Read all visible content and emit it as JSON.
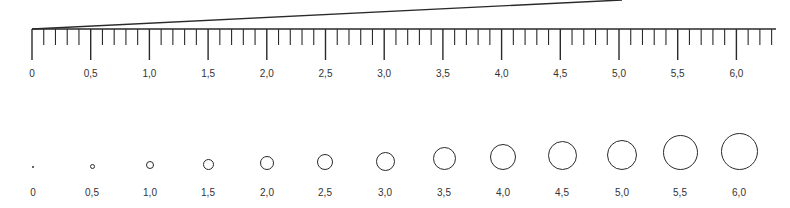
{
  "diagram": {
    "type": "scale-ruler-with-circle-sizes",
    "ruler": {
      "x0": 32,
      "unit_px_per_half": 58.7,
      "baseline_y": 29,
      "end_x": 776,
      "major_tick_bottom": 60,
      "minor_tick_bottom": 45,
      "minor_divisions_per_half": 5,
      "label_y": 69,
      "slant_line": {
        "x1": 32,
        "y1": 29,
        "x2": 622,
        "y2": 0
      },
      "labels": [
        "0",
        "0,5",
        "1,0",
        "1,5",
        "2,0",
        "2,5",
        "3,0",
        "3,5",
        "4,0",
        "4,5",
        "5,0",
        "5,5",
        "6,0"
      ]
    },
    "circles": {
      "label_y": 188,
      "items": [
        {
          "label": "0",
          "cx": 33,
          "cy": 167,
          "d": 2
        },
        {
          "label": "0,5",
          "cx": 92,
          "cy": 166,
          "d": 5
        },
        {
          "label": "1,0",
          "cx": 150,
          "cy": 165,
          "d": 8
        },
        {
          "label": "1,5",
          "cx": 208,
          "cy": 164,
          "d": 11
        },
        {
          "label": "2,0",
          "cx": 267,
          "cy": 163,
          "d": 14
        },
        {
          "label": "2,5",
          "cx": 325,
          "cy": 162,
          "d": 16
        },
        {
          "label": "3,0",
          "cx": 385,
          "cy": 161,
          "d": 19
        },
        {
          "label": "3,5",
          "cx": 444,
          "cy": 158,
          "d": 23
        },
        {
          "label": "4,0",
          "cx": 503,
          "cy": 157,
          "d": 26
        },
        {
          "label": "4,5",
          "cx": 562,
          "cy": 155,
          "d": 29
        },
        {
          "label": "5,0",
          "cx": 622,
          "cy": 155,
          "d": 30
        },
        {
          "label": "5,5",
          "cx": 680,
          "cy": 152,
          "d": 35
        },
        {
          "label": "6,0",
          "cx": 739,
          "cy": 151,
          "d": 37
        }
      ]
    },
    "colors": {
      "stroke": "#2a2a2a",
      "text": "#333333",
      "background": "#ffffff"
    }
  }
}
